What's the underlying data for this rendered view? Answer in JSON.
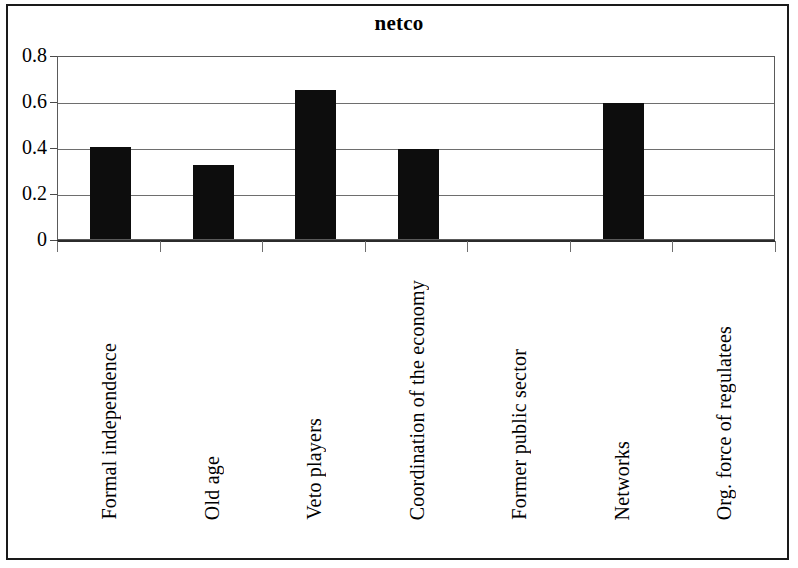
{
  "chart_data": {
    "type": "bar",
    "title": "netco",
    "xlabel": "",
    "ylabel": "",
    "categories": [
      "Formal independence",
      "Old age",
      "Veto players",
      "Coordination of the economy",
      "Former public sector",
      "Networks",
      "Org. force of regulatees"
    ],
    "values": [
      0.4,
      0.32,
      0.65,
      0.39,
      0,
      0.59,
      0
    ],
    "ylim": [
      0,
      0.8
    ],
    "ytick_labels": [
      "0",
      "0.2",
      "0.4",
      "0.6",
      "0.8"
    ],
    "ytick_values": [
      0,
      0.2,
      0.4,
      0.6,
      0.8
    ],
    "grid": true,
    "legend": false,
    "bar_color": "#0d0d0d",
    "gridline_color": "#6e6e6e",
    "axis_color": "#2b2b2b",
    "background_color": "#ffffff"
  },
  "frame": {
    "border_color": "#1a1a1a"
  }
}
